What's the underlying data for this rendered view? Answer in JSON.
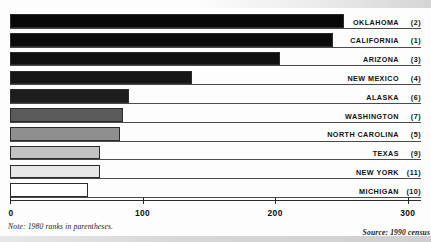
{
  "chart_data": {
    "type": "bar",
    "orientation": "horizontal",
    "title": "",
    "xlabel": "",
    "ylabel": "",
    "xlim": [
      0,
      310
    ],
    "xticks": [
      0,
      100,
      200,
      300
    ],
    "xticklabels": [
      "0",
      "100",
      "200",
      "300"
    ],
    "grid": false,
    "legend": false,
    "categories": [
      "OKLAHOMA",
      "CALIFORNIA",
      "ARIZONA",
      "NEW MEXICO",
      "ALASKA",
      "WASHINGTON",
      "NORTH CAROLINA",
      "TEXAS",
      "NEW YORK",
      "MICHIGAN"
    ],
    "values": [
      252,
      244,
      204,
      137,
      90,
      85,
      83,
      68,
      68,
      59
    ],
    "ranks": [
      "(2)",
      "(1)",
      "(3)",
      "(4)",
      "(6)",
      "(7)",
      "(5)",
      "(9)",
      "(11)",
      "(10)"
    ],
    "bar_fills": [
      "#080808",
      "#0b0b0b",
      "#101010",
      "#161616",
      "#1d1d1d",
      "#5a5a5a",
      "#8f8f8f",
      "#c2c2c2",
      "#e6e6e6",
      "#ffffff"
    ],
    "bar_edge_color": "#2b2b2b",
    "rows": [
      {
        "label": "OKLAHOMA",
        "rank": "(2)",
        "value": 252,
        "fill": "#080808"
      },
      {
        "label": "CALIFORNIA",
        "rank": "(1)",
        "value": 244,
        "fill": "#0b0b0b"
      },
      {
        "label": "ARIZONA",
        "rank": "(3)",
        "value": 204,
        "fill": "#101010"
      },
      {
        "label": "NEW MEXICO",
        "rank": "(4)",
        "value": 137,
        "fill": "#161616"
      },
      {
        "label": "ALASKA",
        "rank": "(6)",
        "value": 90,
        "fill": "#1d1d1d"
      },
      {
        "label": "WASHINGTON",
        "rank": "(7)",
        "value": 85,
        "fill": "#5a5a5a"
      },
      {
        "label": "NORTH CAROLINA",
        "rank": "(5)",
        "value": 83,
        "fill": "#8f8f8f"
      },
      {
        "label": "TEXAS",
        "rank": "(9)",
        "value": 68,
        "fill": "#c2c2c2"
      },
      {
        "label": "NEW YORK",
        "rank": "(11)",
        "value": 68,
        "fill": "#e6e6e6"
      },
      {
        "label": "MICHIGAN",
        "rank": "(10)",
        "value": 59,
        "fill": "#ffffff"
      }
    ]
  },
  "footnotes": {
    "note": "Note: 1980 ranks in parentheses.",
    "source": "Source: 1990 census"
  }
}
